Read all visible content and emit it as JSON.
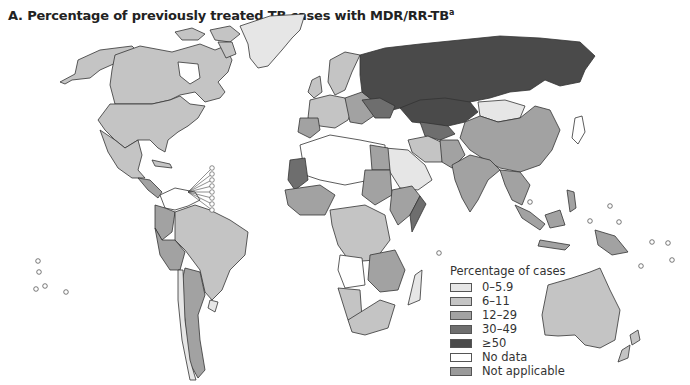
{
  "title": {
    "text": "A. Percentage of previously treated TB cases with MDR/RR-TB",
    "superscript": "a"
  },
  "legend": {
    "title": "Percentage of cases",
    "items": [
      {
        "label": "0–5.9",
        "color": "#e6e6e6"
      },
      {
        "label": "6–11",
        "color": "#c4c4c4"
      },
      {
        "label": "12–29",
        "color": "#a2a2a2"
      },
      {
        "label": "30–49",
        "color": "#6e6e6e"
      },
      {
        "label": "≥50",
        "color": "#4a4a4a"
      },
      {
        "label": "No data",
        "color": "#ffffff"
      },
      {
        "label": "Not applicable",
        "color": "#9a9a9a"
      }
    ]
  },
  "colors": {
    "border": "#333333",
    "background": "#ffffff"
  }
}
